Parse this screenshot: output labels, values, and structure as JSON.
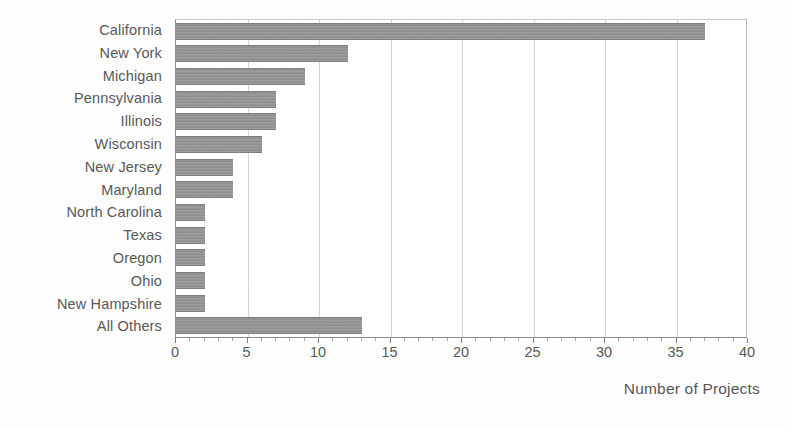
{
  "chart_data": {
    "type": "bar",
    "orientation": "horizontal",
    "title": "",
    "subtitle": "",
    "xlabel": "Number of Projects",
    "ylabel": "",
    "categories": [
      "California",
      "New York",
      "Michigan",
      "Pennsylvania",
      "Illinois",
      "Wisconsin",
      "New Jersey",
      "Maryland",
      "North Carolina",
      "Texas",
      "Oregon",
      "Ohio",
      "New Hampshire",
      "All Others"
    ],
    "values": [
      37,
      12,
      9,
      7,
      7,
      6,
      4,
      4,
      2,
      2,
      2,
      2,
      2,
      13
    ],
    "xlim": [
      0,
      40
    ],
    "xticks": [
      0,
      5,
      10,
      15,
      20,
      25,
      30,
      35,
      40
    ],
    "xtick_labels": [
      "0",
      "5",
      "10",
      "15",
      "20",
      "25",
      "30",
      "35",
      "40"
    ],
    "minor_tick_step": 1,
    "grid": "vertical-major",
    "legend": null,
    "bar_color": "#8f8f8f",
    "axis_color": "#8d8d8d",
    "grid_color": "#d5d5d5",
    "text_color": "#585858",
    "background_color": "#ffffff"
  }
}
